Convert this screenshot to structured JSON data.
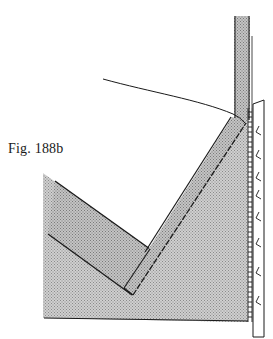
{
  "figure": {
    "label": "Fig. 188b",
    "colors": {
      "fill_grey": "#bdbdbd",
      "fill_grey_dark": "#a9a9a9",
      "line": "#1a1a1a",
      "background": "#ffffff"
    },
    "parts": [
      "vertical-top-strip",
      "right-edge-band",
      "stitched-seam",
      "main-stippled-panel",
      "diagonal-arm",
      "lower-left-arm",
      "curved-guide-line"
    ],
    "edge_mark_glyph": "<",
    "edge_mark_count": 8
  }
}
